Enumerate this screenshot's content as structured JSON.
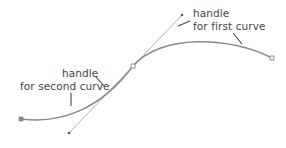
{
  "diagram": {
    "type": "bezier-curve-illustration",
    "colors": {
      "curve": "#8a8a8a",
      "handle_line": "#9a9a9a",
      "anchor": "#777777",
      "text": "#444444",
      "leader": "#444444",
      "background": "#ffffff"
    },
    "points": {
      "start_anchor": {
        "x": 21,
        "y": 119
      },
      "middle_anchor": {
        "x": 133,
        "y": 66
      },
      "end_anchor": {
        "x": 272,
        "y": 58
      },
      "first_curve_handle": {
        "x": 182,
        "y": 15
      },
      "second_curve_handle": {
        "x": 69,
        "y": 133
      }
    },
    "labels": {
      "first": {
        "line1": "handle",
        "line2": "for first curve"
      },
      "second": {
        "line1": "handle",
        "line2": "for second curve"
      }
    }
  }
}
